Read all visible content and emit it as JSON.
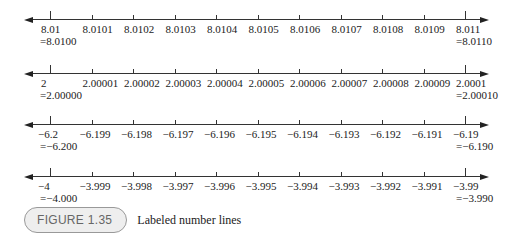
{
  "chart_data": {
    "type": "number_line",
    "title": "Labeled number lines",
    "lines": [
      {
        "labels": [
          "8.01",
          "8.0101",
          "8.0102",
          "8.0103",
          "8.0104",
          "8.0105",
          "8.0106",
          "8.0107",
          "8.0108",
          "8.0109",
          "8.011"
        ],
        "start_eq": "=8.0100",
        "end_eq": "=8.0110",
        "start": 8.01,
        "end": 8.011,
        "step": 0.0001
      },
      {
        "labels": [
          "2",
          "2.00001",
          "2.00002",
          "2.00003",
          "2.00004",
          "2.00005",
          "2.00006",
          "2.00007",
          "2.00008",
          "2.00009",
          "2.0001"
        ],
        "start_eq": "=2.00000",
        "end_eq": "=2.00010",
        "start": 2.0,
        "end": 2.0001,
        "step": 1e-05
      },
      {
        "labels": [
          "−6.2",
          "−6.199",
          "−6.198",
          "−6.197",
          "−6.196",
          "−6.195",
          "−6.194",
          "−6.193",
          "−6.192",
          "−6.191",
          "−6.19"
        ],
        "start_eq": "=−6.200",
        "end_eq": "=−6.190",
        "start": -6.2,
        "end": -6.19,
        "step": 0.001
      },
      {
        "labels": [
          "−4",
          "−3.999",
          "−3.998",
          "−3.997",
          "−3.996",
          "−3.995",
          "−3.994",
          "−3.993",
          "−3.992",
          "−3.991",
          "−3.99"
        ],
        "start_eq": "=−4.000",
        "end_eq": "=−3.990",
        "start": -4.0,
        "end": -3.99,
        "step": 0.001
      }
    ]
  },
  "caption": {
    "badge": "FIGURE 1.35",
    "text": "Labeled number lines"
  }
}
